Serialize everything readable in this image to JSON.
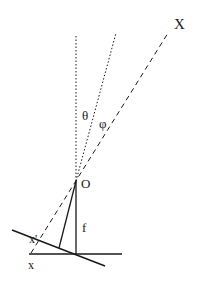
{
  "diagram": {
    "type": "pinhole-camera-geometry",
    "labels": {
      "point_X": "X",
      "angle_theta": "θ",
      "angle_phi": "φ",
      "center_O": "O",
      "focal_f": "f",
      "image_x_prime": "x'",
      "image_x": "x"
    },
    "colors": {
      "stroke": "#1a1a1a",
      "background": "#ffffff"
    },
    "elements": [
      {
        "name": "optical-axis",
        "style": "dotted",
        "from": [
          76,
          181
        ],
        "to": [
          76,
          35
        ]
      },
      {
        "name": "tilted-axis",
        "style": "dotted",
        "from": [
          76,
          181
        ],
        "to": [
          116,
          33
        ]
      },
      {
        "name": "ray-to-X",
        "style": "dashed",
        "from": [
          31,
          253
        ],
        "to": [
          168,
          33
        ]
      },
      {
        "name": "focal-length-segment",
        "style": "solid",
        "from": [
          76,
          181
        ],
        "to": [
          76,
          254
        ]
      },
      {
        "name": "tilted-normal-segment",
        "style": "solid",
        "from": [
          76,
          181
        ],
        "to": [
          59,
          248
        ]
      },
      {
        "name": "image-plane",
        "style": "solid",
        "from": [
          29,
          254
        ],
        "to": [
          122,
          254
        ]
      },
      {
        "name": "tilted-image-plane",
        "style": "solid",
        "from": [
          12,
          230
        ],
        "to": [
          105,
          266
        ]
      }
    ]
  }
}
